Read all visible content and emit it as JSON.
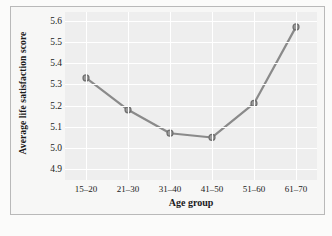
{
  "chart_data": {
    "type": "line",
    "title": "",
    "xlabel": "Age group",
    "ylabel": "Average life satisfaction score",
    "categories": [
      "15–20",
      "21–30",
      "31–40",
      "41–50",
      "51–60",
      "61–70"
    ],
    "values": [
      5.33,
      5.18,
      5.07,
      5.05,
      5.21,
      5.57
    ],
    "series": [
      {
        "name": "Average life satisfaction score",
        "values": [
          5.33,
          5.18,
          5.07,
          5.05,
          5.21,
          5.57
        ]
      }
    ],
    "ylim": [
      4.85,
      5.64
    ],
    "yticks": [
      "4.9",
      "5.0",
      "5.1",
      "5.2",
      "5.3",
      "5.4",
      "5.5",
      "5.6"
    ],
    "ytick_values": [
      4.9,
      5.0,
      5.1,
      5.2,
      5.3,
      5.4,
      5.5,
      5.6
    ],
    "grid": true,
    "legend": "none",
    "colors": {
      "line": "#8a8a8a",
      "marker_face": "#9a9a9a",
      "marker_edge": "#6f6f6f",
      "plot_background": "#eeeeee",
      "gridline": "#ffffff",
      "figure_background": "#f7f7f6",
      "frame_border": "#b9b9b9",
      "text": "#1b1b1b"
    }
  }
}
